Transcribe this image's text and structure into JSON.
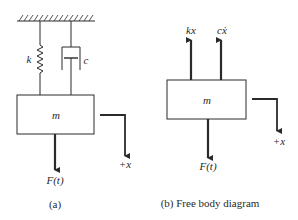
{
  "diagram": {
    "colors": {
      "line": "#2a2a2a",
      "background": "#ffffff"
    },
    "panel_a": {
      "spring_label": "k",
      "damper_label": "c",
      "mass_label": "m",
      "force_label": "F(t)",
      "direction_label": "+x",
      "caption": "(a)"
    },
    "panel_b": {
      "spring_force_label": "kx",
      "damper_force_label": "cẋ",
      "mass_label": "m",
      "force_label": "F(t)",
      "direction_label": "+x",
      "caption": "(b) Free body diagram"
    }
  }
}
